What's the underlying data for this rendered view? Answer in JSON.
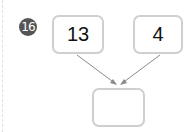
{
  "problem": {
    "number": "16",
    "inputs": [
      {
        "value": "13"
      },
      {
        "value": "4"
      }
    ],
    "answer": {
      "value": ""
    }
  },
  "colors": {
    "badge": "#555555",
    "box_border": "#cfcfcf",
    "arrow": "#8a8a8a"
  }
}
